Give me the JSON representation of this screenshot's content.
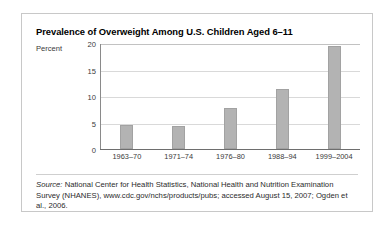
{
  "figure": {
    "title": "Prevalence of Overweight Among U.S. Children Aged 6–11",
    "source_word": "Source:",
    "source_line1": " National Center for Health Statistics, National Health and Nutrition Examination",
    "source_line2": "Survey (NHANES), www.cdc.gov/nchs/products/pubs; accessed August 15, 2007;",
    "source_line3": "Ogden et al., 2006."
  },
  "colors": {
    "bar_fill": "#b3b3b3",
    "bar_edge": "#a2a2a2",
    "gridline": "#d9d9d9",
    "frame_border": "#c8c8c8",
    "axis": "#6e6e6e",
    "text": "#2b2b2b"
  },
  "chart_data": {
    "type": "bar",
    "title": "Prevalence of Overweight Among U.S. Children Aged 6–11",
    "xlabel": "",
    "ylabel": "Percent",
    "categories": [
      "1963–70",
      "1971–74",
      "1976–80",
      "1988–94",
      "1999–2004"
    ],
    "values": [
      4.5,
      4.3,
      7.8,
      11.3,
      19.4
    ],
    "ylim": [
      0,
      20
    ],
    "yticks": [
      0,
      5,
      10,
      15,
      20
    ],
    "ytick_labels": [
      "0",
      "5",
      "10",
      "15",
      "20"
    ],
    "grid": "horizontal",
    "legend": "none"
  }
}
